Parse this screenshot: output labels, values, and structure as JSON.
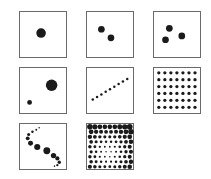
{
  "figure": {
    "background": "#ffffff",
    "border_color": "#6a6a6a",
    "dot_color": "#1a1a1a",
    "panels": [
      {
        "id": "one-dot",
        "label": "Single large dot",
        "box": [
          19,
          11
        ],
        "dots": [
          [
            22,
            22,
            5
          ]
        ]
      },
      {
        "id": "two-dots",
        "label": "Two dots",
        "box": [
          86,
          11
        ],
        "dots": [
          [
            15,
            18,
            3.5
          ],
          [
            25,
            27,
            3.5
          ]
        ]
      },
      {
        "id": "three-dots",
        "label": "Three dots",
        "box": [
          153,
          11
        ],
        "dots": [
          [
            16,
            17,
            3.5
          ],
          [
            12,
            29,
            3.5
          ],
          [
            29,
            25,
            3.5
          ]
        ]
      },
      {
        "id": "big-and-small-dot",
        "label": "One large and one small dot",
        "box": [
          19,
          67
        ],
        "dots": [
          [
            33,
            18,
            6
          ],
          [
            10,
            36,
            2.5
          ]
        ]
      },
      {
        "id": "dotted-line",
        "label": "Diagonal line of small dots",
        "box": [
          86,
          67
        ],
        "dots": [
          [
            6,
            33,
            1.3
          ],
          [
            10.5,
            30.3,
            1.3
          ],
          [
            15,
            27.6,
            1.3
          ],
          [
            19.5,
            24.9,
            1.3
          ],
          [
            24,
            22.2,
            1.3
          ],
          [
            28.5,
            19.5,
            1.3
          ],
          [
            33,
            16.8,
            1.3
          ],
          [
            37.5,
            14.1,
            1.3
          ],
          [
            42,
            11.4,
            1.3
          ]
        ]
      },
      {
        "id": "dot-grid",
        "label": "Regular grid of dots (7 columns x 6 rows)",
        "box": [
          153,
          67
        ],
        "grid": {
          "cols": 7,
          "rows": 6,
          "x0": 5,
          "y0": 5,
          "dx": 6.3,
          "dy": 7.2,
          "r": 1.7
        }
      },
      {
        "id": "s-curve",
        "label": "S-curve of dots varying in size",
        "box": [
          19,
          123
        ],
        "dots": [
          [
            20,
            4,
            0.8
          ],
          [
            17,
            6,
            1
          ],
          [
            13,
            8,
            1.3
          ],
          [
            9,
            11,
            1.6
          ],
          [
            8,
            15,
            2
          ],
          [
            11,
            20,
            2.6
          ],
          [
            18,
            24,
            3.2
          ],
          [
            28,
            28,
            3.6
          ],
          [
            35,
            33,
            2.8
          ],
          [
            39,
            36,
            2.2
          ],
          [
            41,
            40,
            1.8
          ],
          [
            39,
            43,
            1.2
          ],
          [
            36,
            44,
            0.8
          ]
        ]
      },
      {
        "id": "dense-field",
        "label": "Dense field of dots, large at edges, small toward centre",
        "box": [
          86,
          123
        ],
        "field": {
          "cols": 9,
          "rows": 9,
          "x0": 3,
          "y0": 3,
          "dx": 5.2,
          "dy": 5.2,
          "rmin": 0.7,
          "rmax": 3.0,
          "cx": 22,
          "cy": 30
        }
      }
    ]
  }
}
